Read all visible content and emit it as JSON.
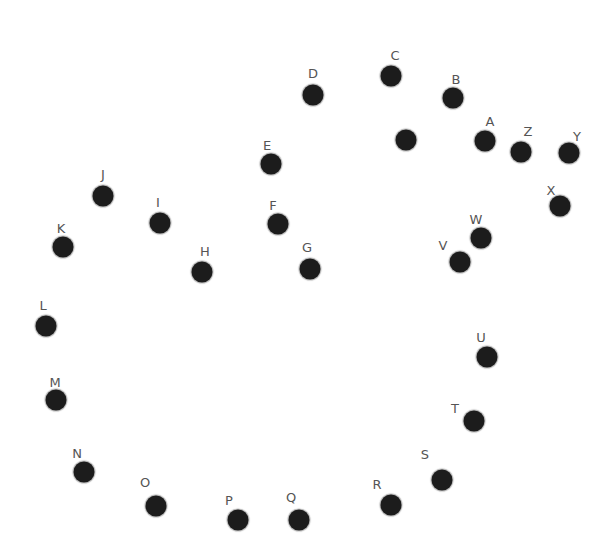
{
  "puzzle": {
    "type": "connect-the-dots",
    "dot_color": "#1c1c1c",
    "label_color": "#555555",
    "dots": [
      {
        "label": "A",
        "x": 485,
        "y": 141,
        "lx": 490,
        "ly": 121
      },
      {
        "label": "B",
        "x": 453,
        "y": 98,
        "lx": 456,
        "ly": 79
      },
      {
        "label": "C",
        "x": 391,
        "y": 76,
        "lx": 395,
        "ly": 55
      },
      {
        "label": "D",
        "x": 313,
        "y": 95,
        "lx": 313,
        "ly": 73
      },
      {
        "label": "E",
        "x": 271,
        "y": 164,
        "lx": 267,
        "ly": 145
      },
      {
        "label": "F",
        "x": 278,
        "y": 224,
        "lx": 273,
        "ly": 205
      },
      {
        "label": "G",
        "x": 310,
        "y": 269,
        "lx": 307,
        "ly": 247
      },
      {
        "label": "H",
        "x": 202,
        "y": 272,
        "lx": 205,
        "ly": 251
      },
      {
        "label": "I",
        "x": 160,
        "y": 223,
        "lx": 158,
        "ly": 202
      },
      {
        "label": "J",
        "x": 103,
        "y": 196,
        "lx": 103,
        "ly": 174
      },
      {
        "label": "K",
        "x": 63,
        "y": 247,
        "lx": 61,
        "ly": 228
      },
      {
        "label": "L",
        "x": 46,
        "y": 326,
        "lx": 43,
        "ly": 305
      },
      {
        "label": "M",
        "x": 56,
        "y": 400,
        "lx": 55,
        "ly": 382
      },
      {
        "label": "N",
        "x": 84,
        "y": 472,
        "lx": 77,
        "ly": 453
      },
      {
        "label": "O",
        "x": 156,
        "y": 506,
        "lx": 145,
        "ly": 482
      },
      {
        "label": "P",
        "x": 238,
        "y": 520,
        "lx": 229,
        "ly": 500
      },
      {
        "label": "Q",
        "x": 299,
        "y": 520,
        "lx": 291,
        "ly": 497
      },
      {
        "label": "R",
        "x": 391,
        "y": 505,
        "lx": 377,
        "ly": 484
      },
      {
        "label": "S",
        "x": 442,
        "y": 480,
        "lx": 425,
        "ly": 454
      },
      {
        "label": "T",
        "x": 474,
        "y": 421,
        "lx": 455,
        "ly": 408
      },
      {
        "label": "U",
        "x": 487,
        "y": 357,
        "lx": 481,
        "ly": 337
      },
      {
        "label": "V",
        "x": 460,
        "y": 262,
        "lx": 443,
        "ly": 245
      },
      {
        "label": "W",
        "x": 481,
        "y": 238,
        "lx": 476,
        "ly": 219
      },
      {
        "label": "X",
        "x": 560,
        "y": 206,
        "lx": 551,
        "ly": 190
      },
      {
        "label": "Y",
        "x": 569,
        "y": 153,
        "lx": 577,
        "ly": 136
      },
      {
        "label": "Z",
        "x": 521,
        "y": 152,
        "lx": 528,
        "ly": 131
      },
      {
        "label": "",
        "x": 406,
        "y": 140,
        "lx": null,
        "ly": null
      }
    ]
  }
}
